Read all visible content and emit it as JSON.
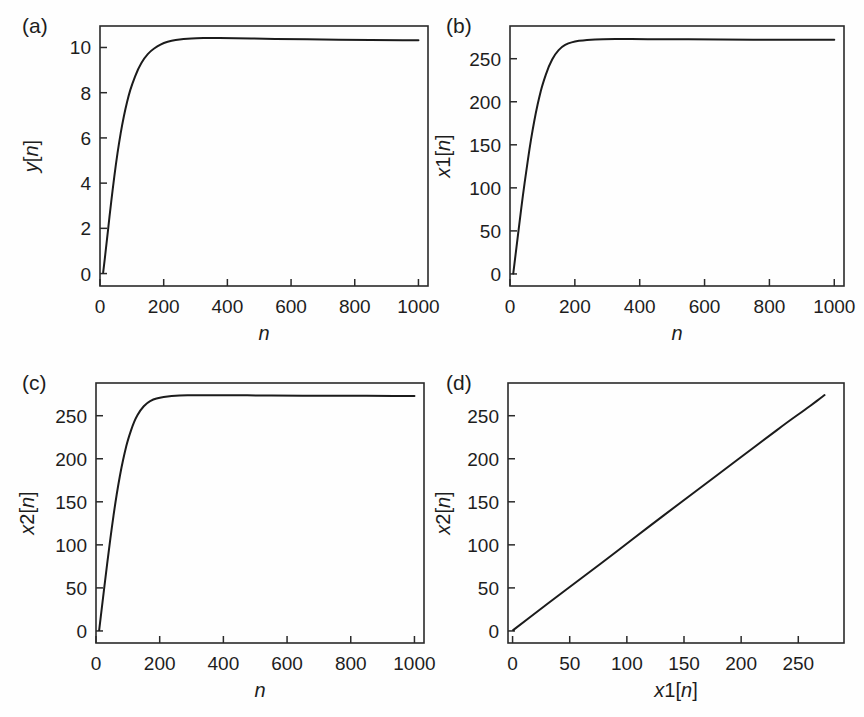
{
  "figure": {
    "background": "#fefefe",
    "line_color": "#1b1b1b",
    "axis_color": "#2a2a2a",
    "width": 864,
    "height": 717
  },
  "panels": [
    {
      "letter": "(a)",
      "ylabel_var": "y",
      "ylabel_sub": "",
      "ylabel_idx": "[n]",
      "xlabel_var": "n",
      "xlabel_sub": "",
      "xlabel_idx": "",
      "xticks": [
        "0",
        "200",
        "400",
        "600",
        "800",
        "1000"
      ],
      "yticks": [
        "0",
        "2",
        "4",
        "6",
        "8",
        "10"
      ]
    },
    {
      "letter": "(b)",
      "ylabel_var": "x",
      "ylabel_sub": "1",
      "ylabel_idx": "[n]",
      "xlabel_var": "n",
      "xlabel_sub": "",
      "xlabel_idx": "",
      "xticks": [
        "0",
        "200",
        "400",
        "600",
        "800",
        "1000"
      ],
      "yticks": [
        "0",
        "50",
        "100",
        "150",
        "200",
        "250"
      ]
    },
    {
      "letter": "(c)",
      "ylabel_var": "x",
      "ylabel_sub": "2",
      "ylabel_idx": "[n]",
      "xlabel_var": "n",
      "xlabel_sub": "",
      "xlabel_idx": "",
      "xticks": [
        "0",
        "200",
        "400",
        "600",
        "800",
        "1000"
      ],
      "yticks": [
        "0",
        "50",
        "100",
        "150",
        "200",
        "250"
      ]
    },
    {
      "letter": "(d)",
      "ylabel_var": "x",
      "ylabel_sub": "2",
      "ylabel_idx": "[n]",
      "xlabel_var": "x",
      "xlabel_sub": "1",
      "xlabel_idx": "[n]",
      "xticks": [
        "0",
        "50",
        "100",
        "150",
        "200",
        "250"
      ],
      "yticks": [
        "0",
        "50",
        "100",
        "150",
        "200",
        "250"
      ]
    }
  ],
  "chart_data": [
    {
      "id": "panel-a",
      "type": "line",
      "title": "(a)",
      "xlabel": "n",
      "ylabel": "y[n]",
      "xlim": [
        0,
        1030
      ],
      "ylim": [
        -0.55,
        10.95
      ],
      "xticks": [
        0,
        200,
        400,
        600,
        800,
        1000
      ],
      "yticks": [
        0,
        2,
        4,
        6,
        8,
        10
      ],
      "grid": false,
      "legend": "none",
      "x": [
        10,
        20,
        30,
        40,
        50,
        60,
        70,
        80,
        90,
        100,
        120,
        140,
        160,
        180,
        200,
        225,
        250,
        275,
        300,
        350,
        400,
        450,
        500,
        600,
        700,
        800,
        900,
        1000
      ],
      "y": [
        0.05,
        1.25,
        2.55,
        3.75,
        4.85,
        5.8,
        6.62,
        7.3,
        7.88,
        8.35,
        9.08,
        9.55,
        9.86,
        10.05,
        10.2,
        10.3,
        10.36,
        10.39,
        10.41,
        10.42,
        10.41,
        10.4,
        10.39,
        10.37,
        10.35,
        10.34,
        10.33,
        10.32
      ]
    },
    {
      "id": "panel-b",
      "type": "line",
      "title": "(b)",
      "xlabel": "n",
      "ylabel": "x1[n]",
      "xlim": [
        0,
        1030
      ],
      "ylim": [
        -14,
        288
      ],
      "xticks": [
        0,
        200,
        400,
        600,
        800,
        1000
      ],
      "yticks": [
        0,
        50,
        100,
        150,
        200,
        250
      ],
      "grid": false,
      "legend": "none",
      "x": [
        10,
        20,
        30,
        40,
        50,
        60,
        70,
        80,
        90,
        100,
        120,
        140,
        160,
        180,
        200,
        225,
        250,
        275,
        300,
        350,
        400,
        450,
        500,
        600,
        700,
        800,
        900,
        1000
      ],
      "y": [
        0.5,
        31,
        62,
        92,
        119,
        145,
        168,
        188,
        205,
        220,
        242,
        256,
        264,
        268,
        270,
        271.5,
        272.2,
        272.6,
        272.8,
        272.9,
        272.8,
        272.7,
        272.6,
        272.4,
        272.2,
        272.1,
        272.0,
        271.9
      ]
    },
    {
      "id": "panel-c",
      "type": "line",
      "title": "(c)",
      "xlabel": "n",
      "ylabel": "x2[n]",
      "xlim": [
        0,
        1030
      ],
      "ylim": [
        -14,
        288
      ],
      "xticks": [
        0,
        200,
        400,
        600,
        800,
        1000
      ],
      "yticks": [
        0,
        50,
        100,
        150,
        200,
        250
      ],
      "grid": false,
      "legend": "none",
      "x": [
        10,
        20,
        30,
        40,
        50,
        60,
        70,
        80,
        90,
        100,
        120,
        140,
        160,
        180,
        200,
        225,
        250,
        275,
        300,
        350,
        400,
        450,
        500,
        600,
        700,
        800,
        900,
        1000
      ],
      "y": [
        1.0,
        32,
        63,
        93,
        121,
        147,
        170,
        190,
        207,
        222,
        244,
        257,
        265,
        269,
        271,
        272.5,
        273.2,
        273.6,
        273.8,
        273.9,
        273.8,
        273.7,
        273.6,
        273.4,
        273.2,
        273.1,
        273.0,
        272.9
      ]
    },
    {
      "id": "panel-d",
      "type": "line",
      "title": "(d)",
      "xlabel": "x1[n]",
      "ylabel": "x2[n]",
      "xlim": [
        -4,
        290
      ],
      "ylim": [
        -14,
        288
      ],
      "xticks": [
        0,
        50,
        100,
        150,
        200,
        250
      ],
      "yticks": [
        0,
        50,
        100,
        150,
        200,
        250
      ],
      "grid": false,
      "legend": "none",
      "x": [
        0.5,
        31,
        62,
        92,
        119,
        145,
        168,
        188,
        205,
        220,
        242,
        256,
        264,
        268,
        270,
        271.5,
        272.2,
        272.6,
        272.8,
        272.9
      ],
      "y": [
        1.0,
        32,
        63,
        93,
        121,
        147,
        170,
        190,
        207,
        222,
        244,
        257,
        265,
        269,
        271,
        272.5,
        273.2,
        273.6,
        273.8,
        273.9
      ]
    }
  ]
}
